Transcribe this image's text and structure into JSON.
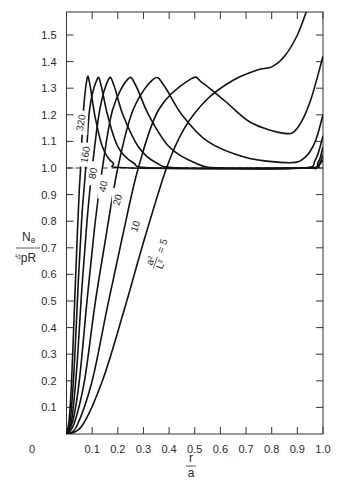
{
  "chart_data": {
    "type": "line",
    "title": "",
    "xlabel": "r / a",
    "ylabel": "N_θ / (½ pR)",
    "xlim": [
      0,
      1.0
    ],
    "ylim": [
      0,
      1.6
    ],
    "x_ticks": [
      "0.1",
      "0.2",
      "0.3",
      "0.4",
      "0.5",
      "0.6",
      "0.7",
      "0.8",
      "0.9",
      "1.0"
    ],
    "y_ticks": [
      "0",
      "0.1",
      "0.2",
      "0.3",
      "0.4",
      "0.5",
      "0.6",
      "0.7",
      "0.8",
      "0.9",
      "1.0",
      "1.1",
      "1.2",
      "1.3",
      "1.4",
      "1.5"
    ],
    "x_origin_label": "0",
    "grid": false,
    "reference_line": {
      "y": 1.0,
      "style": "dashed"
    },
    "parameter_label": "a²/L² = 5",
    "series": [
      {
        "name": "320",
        "label": "320",
        "points": [
          [
            0,
            0
          ],
          [
            0.01,
            0.05
          ],
          [
            0.02,
            0.2
          ],
          [
            0.03,
            0.45
          ],
          [
            0.04,
            0.7
          ],
          [
            0.05,
            0.92
          ],
          [
            0.055,
            1.0
          ],
          [
            0.065,
            1.2
          ],
          [
            0.08,
            1.335
          ],
          [
            0.09,
            1.32
          ],
          [
            0.11,
            1.2
          ],
          [
            0.14,
            1.08
          ],
          [
            0.18,
            1.02
          ],
          [
            0.25,
            1.0
          ],
          [
            0.9,
            1.0
          ],
          [
            0.97,
            1.0
          ],
          [
            1.0,
            1.03
          ]
        ]
      },
      {
        "name": "160",
        "label": "160",
        "points": [
          [
            0,
            0
          ],
          [
            0.015,
            0.05
          ],
          [
            0.03,
            0.25
          ],
          [
            0.045,
            0.55
          ],
          [
            0.06,
            0.82
          ],
          [
            0.075,
            1.0
          ],
          [
            0.09,
            1.22
          ],
          [
            0.12,
            1.335
          ],
          [
            0.135,
            1.31
          ],
          [
            0.16,
            1.2
          ],
          [
            0.2,
            1.08
          ],
          [
            0.26,
            1.02
          ],
          [
            0.35,
            1.0
          ],
          [
            0.92,
            1.0
          ],
          [
            0.98,
            1.01
          ],
          [
            1.0,
            1.05
          ]
        ]
      },
      {
        "name": "80",
        "label": "80",
        "points": [
          [
            0,
            0
          ],
          [
            0.02,
            0.05
          ],
          [
            0.04,
            0.25
          ],
          [
            0.06,
            0.55
          ],
          [
            0.08,
            0.8
          ],
          [
            0.1,
            1.0
          ],
          [
            0.13,
            1.22
          ],
          [
            0.165,
            1.335
          ],
          [
            0.185,
            1.31
          ],
          [
            0.22,
            1.2
          ],
          [
            0.28,
            1.08
          ],
          [
            0.35,
            1.02
          ],
          [
            0.45,
            1.0
          ],
          [
            0.93,
            1.0
          ],
          [
            0.98,
            1.02
          ],
          [
            1.0,
            1.08
          ]
        ]
      },
      {
        "name": "40",
        "label": "40",
        "points": [
          [
            0,
            0
          ],
          [
            0.025,
            0.05
          ],
          [
            0.05,
            0.2
          ],
          [
            0.08,
            0.5
          ],
          [
            0.11,
            0.78
          ],
          [
            0.14,
            1.0
          ],
          [
            0.18,
            1.22
          ],
          [
            0.24,
            1.335
          ],
          [
            0.27,
            1.31
          ],
          [
            0.32,
            1.2
          ],
          [
            0.4,
            1.08
          ],
          [
            0.5,
            1.02
          ],
          [
            0.6,
            1.0
          ],
          [
            0.92,
            1.0
          ],
          [
            0.97,
            1.03
          ],
          [
            1.0,
            1.12
          ]
        ]
      },
      {
        "name": "20",
        "label": "20",
        "points": [
          [
            0,
            0
          ],
          [
            0.03,
            0.04
          ],
          [
            0.07,
            0.2
          ],
          [
            0.11,
            0.48
          ],
          [
            0.15,
            0.72
          ],
          [
            0.2,
            1.0
          ],
          [
            0.26,
            1.22
          ],
          [
            0.34,
            1.335
          ],
          [
            0.38,
            1.31
          ],
          [
            0.45,
            1.2
          ],
          [
            0.55,
            1.1
          ],
          [
            0.7,
            1.04
          ],
          [
            0.87,
            1.02
          ],
          [
            0.93,
            1.04
          ],
          [
            0.97,
            1.1
          ],
          [
            1.0,
            1.2
          ]
        ]
      },
      {
        "name": "10",
        "label": "10",
        "points": [
          [
            0,
            0
          ],
          [
            0.04,
            0.03
          ],
          [
            0.1,
            0.2
          ],
          [
            0.16,
            0.48
          ],
          [
            0.22,
            0.75
          ],
          [
            0.28,
            1.0
          ],
          [
            0.36,
            1.22
          ],
          [
            0.485,
            1.335
          ],
          [
            0.53,
            1.32
          ],
          [
            0.62,
            1.25
          ],
          [
            0.72,
            1.17
          ],
          [
            0.85,
            1.13
          ],
          [
            0.9,
            1.15
          ],
          [
            0.95,
            1.25
          ],
          [
            1.0,
            1.42
          ]
        ]
      },
      {
        "name": "5",
        "label": "a²/L² = 5",
        "points": [
          [
            0,
            0
          ],
          [
            0.06,
            0.03
          ],
          [
            0.14,
            0.2
          ],
          [
            0.22,
            0.45
          ],
          [
            0.3,
            0.72
          ],
          [
            0.39,
            1.0
          ],
          [
            0.46,
            1.15
          ],
          [
            0.55,
            1.26
          ],
          [
            0.65,
            1.33
          ],
          [
            0.75,
            1.37
          ],
          [
            0.8,
            1.38
          ],
          [
            0.85,
            1.42
          ],
          [
            0.9,
            1.5
          ],
          [
            0.94,
            1.6
          ]
        ]
      }
    ]
  }
}
